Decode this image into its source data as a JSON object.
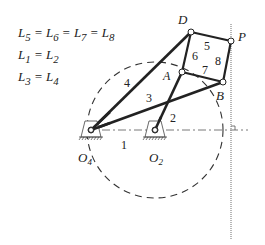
{
  "equations": [
    {
      "text": "L5 = L6 = L7 = L8",
      "parts": [
        "L",
        "5",
        " = ",
        "L",
        "6",
        " = ",
        "L",
        "7",
        " = ",
        "L",
        "8"
      ]
    },
    {
      "text": "L1 = L2"
    },
    {
      "text": "L3 = L4"
    }
  ],
  "points": {
    "D": {
      "label": "D",
      "x": 191,
      "y": 32
    },
    "P": {
      "label": "P",
      "x": 231,
      "y": 41
    },
    "A": {
      "label": "A",
      "x": 182,
      "y": 72
    },
    "B": {
      "label": "B",
      "x": 223,
      "y": 82
    },
    "O4": {
      "label": "O",
      "sub": "4",
      "x": 91,
      "y": 130
    },
    "O2": {
      "label": "O",
      "sub": "2",
      "x": 155,
      "y": 130
    }
  },
  "links": {
    "l1": "1",
    "l2": "2",
    "l3": "3",
    "l4": "4",
    "l5": "5",
    "l6": "6",
    "l7": "7",
    "l8": "8"
  },
  "colors": {
    "line": "#222222",
    "dash": "#333333",
    "dotted": "#888888"
  }
}
